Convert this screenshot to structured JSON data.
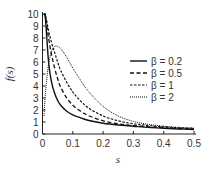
{
  "chart_data": {
    "type": "line",
    "title": "",
    "xlabel": "s",
    "ylabel": "f(s)",
    "xlim": [
      0,
      0.5
    ],
    "ylim": [
      0,
      10
    ],
    "xticks": [
      "0",
      "0.1",
      "0.2",
      "0.3",
      "0.4",
      "0.5"
    ],
    "xtick_values": [
      0,
      0.1,
      0.2,
      0.3,
      0.4,
      0.5
    ],
    "yticks": [
      "0",
      "1",
      "2",
      "3",
      "4",
      "5",
      "6",
      "7",
      "8",
      "9",
      "10"
    ],
    "ytick_values": [
      0,
      1,
      2,
      3,
      4,
      5,
      6,
      7,
      8,
      9,
      10
    ],
    "grid": false,
    "legend_position": "right-center",
    "x": [
      0.005,
      0.01,
      0.02,
      0.03,
      0.04,
      0.05,
      0.06,
      0.08,
      0.1,
      0.12,
      0.15,
      0.2,
      0.25,
      0.3,
      0.35,
      0.4,
      0.45,
      0.5
    ],
    "series": [
      {
        "name": "β = 0.2",
        "style": "solid",
        "values": [
          10,
          9.5,
          6.0,
          4.3,
          3.4,
          2.8,
          2.4,
          1.9,
          1.6,
          1.4,
          1.15,
          0.9,
          0.75,
          0.65,
          0.55,
          0.48,
          0.42,
          0.38
        ]
      },
      {
        "name": "β = 0.5",
        "style": "dashed",
        "values": [
          10,
          9.8,
          8.0,
          6.6,
          5.5,
          4.6,
          3.9,
          3.0,
          2.4,
          2.0,
          1.55,
          1.1,
          0.85,
          0.7,
          0.6,
          0.52,
          0.46,
          0.42
        ]
      },
      {
        "name": "β = 1",
        "style": "dash-dot",
        "values": [
          10,
          9.9,
          8.6,
          7.6,
          6.8,
          6.0,
          5.3,
          4.3,
          3.5,
          2.9,
          2.2,
          1.5,
          1.1,
          0.85,
          0.7,
          0.6,
          0.52,
          0.47
        ]
      },
      {
        "name": "β = 2",
        "style": "dotted",
        "values": [
          1.5,
          3.5,
          5.8,
          6.9,
          7.3,
          7.3,
          7.1,
          6.4,
          5.5,
          4.7,
          3.6,
          2.3,
          1.5,
          1.05,
          0.8,
          0.65,
          0.55,
          0.48
        ]
      }
    ]
  }
}
